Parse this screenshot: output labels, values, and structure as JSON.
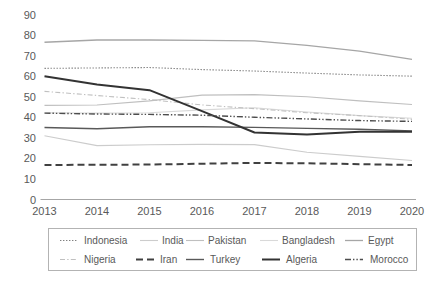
{
  "chart_data": {
    "type": "line",
    "title": "",
    "xlabel": "",
    "ylabel": "",
    "x": [
      2013,
      2014,
      2015,
      2016,
      2017,
      2018,
      2019,
      2020
    ],
    "categories": [
      "2013",
      "2014",
      "2015",
      "2016",
      "2017",
      "2018",
      "2019",
      "2020"
    ],
    "ylim": [
      0,
      90
    ],
    "yticks": [
      0,
      10,
      20,
      30,
      40,
      50,
      60,
      70,
      80,
      90
    ],
    "ytick_labels": [
      "0",
      "10",
      "20",
      "30",
      "40",
      "50",
      "60",
      "70",
      "80",
      "90"
    ],
    "grid": false,
    "legend_position": "bottom",
    "series": [
      {
        "name": "Indonesia",
        "values": [
          63.8,
          64.0,
          64.2,
          63.2,
          62.5,
          61.5,
          60.6,
          60.0
        ],
        "style": "dotted",
        "color": "#808080",
        "width": 1.1
      },
      {
        "name": "India",
        "values": [
          31.0,
          26.2,
          26.6,
          26.8,
          26.7,
          23.0,
          21.0,
          19.0
        ],
        "style": "solid",
        "color": "#cccccc",
        "width": 1.1
      },
      {
        "name": "Pakistan",
        "values": [
          45.8,
          46.0,
          48.0,
          50.8,
          51.0,
          50.0,
          48.0,
          46.2
        ],
        "style": "solid",
        "color": "#bfbfbf",
        "width": 1.1
      },
      {
        "name": "Bangladesh",
        "values": [
          42.2,
          42.0,
          42.2,
          43.6,
          44.6,
          42.6,
          40.8,
          39.5
        ],
        "style": "solid",
        "color": "#d9d9d9",
        "width": 1.1
      },
      {
        "name": "Egypt",
        "values": [
          76.5,
          77.6,
          77.6,
          77.4,
          77.2,
          75.0,
          72.2,
          68.2
        ],
        "style": "solid",
        "color": "#a6a6a6",
        "width": 1.3
      },
      {
        "name": "Nigeria",
        "values": [
          52.6,
          50.6,
          48.6,
          46.0,
          44.2,
          42.2,
          40.8,
          39.0
        ],
        "style": "dashdot",
        "color": "#c0c0c0",
        "width": 1.1
      },
      {
        "name": "Iran",
        "values": [
          16.8,
          16.9,
          17.0,
          17.4,
          17.8,
          17.6,
          17.2,
          16.8
        ],
        "style": "longdash",
        "color": "#404040",
        "width": 2.0
      },
      {
        "name": "Turkey",
        "values": [
          35.0,
          34.4,
          35.4,
          35.4,
          35.1,
          34.6,
          34.2,
          33.4
        ],
        "style": "solid",
        "color": "#595959",
        "width": 1.4
      },
      {
        "name": "Algeria",
        "values": [
          60.0,
          56.0,
          53.2,
          43.0,
          32.6,
          31.6,
          33.0,
          33.0
        ],
        "style": "solid",
        "color": "#333333",
        "width": 2.0
      },
      {
        "name": "Morocco",
        "values": [
          42.0,
          41.6,
          41.4,
          41.0,
          40.0,
          39.2,
          38.4,
          38.0
        ],
        "style": "dashdotdot",
        "color": "#4d4d4d",
        "width": 1.4
      }
    ]
  },
  "legend": {
    "row1": [
      "Indonesia",
      "India",
      "Pakistan",
      "Bangladesh",
      "Egypt"
    ],
    "row2": [
      "Nigeria",
      "Iran",
      "Turkey",
      "Algeria",
      "Morocco"
    ]
  }
}
